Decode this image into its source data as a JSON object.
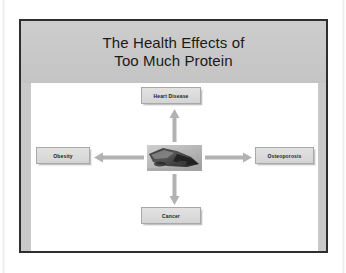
{
  "slide": {
    "title_line_1": "The Health Effects of",
    "title_line_2": "Too Much Protein",
    "center_image_alt": "meat-photo",
    "nodes": [
      {
        "id": "heart-disease",
        "label": "Heart Disease",
        "position": "top"
      },
      {
        "id": "obesity",
        "label": "Obesity",
        "position": "left"
      },
      {
        "id": "osteoporosis",
        "label": "Osteoporosis",
        "position": "right"
      },
      {
        "id": "cancer",
        "label": "Cancer",
        "position": "bottom"
      }
    ],
    "arrows": [
      {
        "id": "arrow-up",
        "direction": "up",
        "from": "center",
        "to": "heart-disease"
      },
      {
        "id": "arrow-left",
        "direction": "left",
        "from": "center",
        "to": "obesity"
      },
      {
        "id": "arrow-right",
        "direction": "right",
        "from": "center",
        "to": "osteoporosis"
      },
      {
        "id": "arrow-down",
        "direction": "down",
        "from": "center",
        "to": "cancer"
      }
    ],
    "colors": {
      "slide_background": "#c9c9c9",
      "slide_border": "#2e2e2e",
      "canvas_background": "#ffffff",
      "node_fill": "#dcdcdc",
      "node_border": "#a8a8a8",
      "arrow_fill": "#b0b0b0",
      "title_text": "#1a1a1a"
    }
  }
}
